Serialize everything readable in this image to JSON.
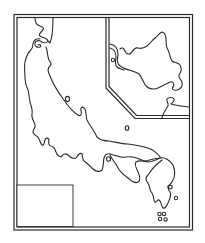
{
  "map": {
    "title": "Outline map",
    "main_region": "main-island",
    "inset_region": "northern-island-inset",
    "stroke_color": "#2a2a2a",
    "background_color": "#ffffff",
    "legend_box": {
      "label": ""
    },
    "islands_count_visible": 6
  }
}
